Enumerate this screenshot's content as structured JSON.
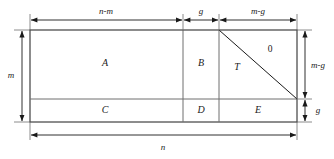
{
  "figure": {
    "type": "geometric-partition-diagram",
    "background_color": "#ffffff",
    "line_color": "#1a1a1a"
  },
  "regions": [
    {
      "id": "A",
      "label": "A",
      "cx": 105,
      "cy": 64
    },
    {
      "id": "B",
      "label": "B",
      "cx": 201,
      "cy": 64
    },
    {
      "id": "T",
      "label": "T",
      "cx": 237,
      "cy": 68
    },
    {
      "id": "Z",
      "label": "0",
      "cx": 270,
      "cy": 50
    },
    {
      "id": "C",
      "label": "C",
      "cx": 105,
      "cy": 111
    },
    {
      "id": "D",
      "label": "D",
      "cx": 201,
      "cy": 111
    },
    {
      "id": "E",
      "label": "E",
      "cx": 258,
      "cy": 111
    }
  ],
  "dimensions": {
    "top": [
      {
        "id": "n-minus-m",
        "label": "n-m",
        "cx": 106,
        "cy": 12
      },
      {
        "id": "g",
        "label": "g",
        "cx": 201,
        "cy": 12
      },
      {
        "id": "m-minus-g",
        "label": "m-g",
        "cx": 258,
        "cy": 12
      }
    ],
    "left": [
      {
        "id": "m",
        "label": "m",
        "cx": 11,
        "cy": 76
      }
    ],
    "right": [
      {
        "id": "m-minus-g-right",
        "label": "m-g",
        "cx": 318,
        "cy": 66
      },
      {
        "id": "g-right",
        "label": "g",
        "cx": 318,
        "cy": 111
      }
    ],
    "bottom": [
      {
        "id": "n",
        "label": "n",
        "cx": 163,
        "cy": 148
      }
    ]
  }
}
